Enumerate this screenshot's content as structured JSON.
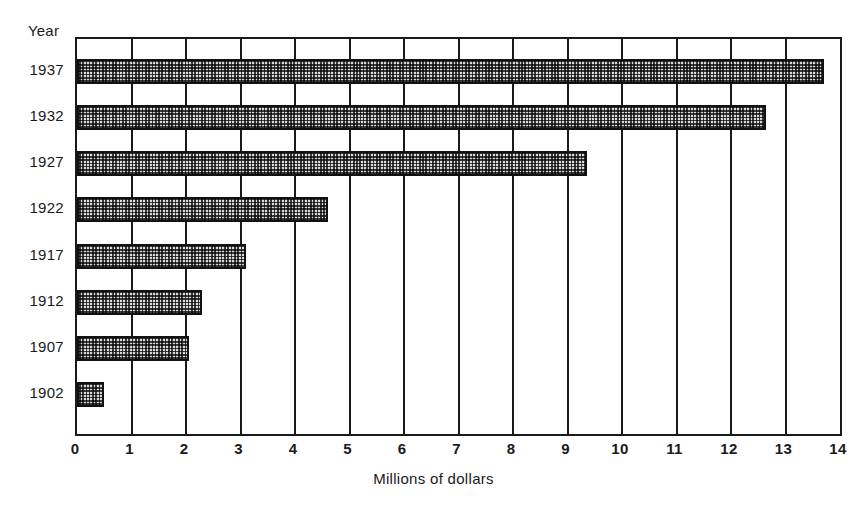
{
  "chart_data": {
    "type": "bar",
    "orientation": "horizontal",
    "title": "",
    "xlabel": "Millions of dollars",
    "ylabel": "Year",
    "categories": [
      "1937",
      "1932",
      "1927",
      "1922",
      "1917",
      "1912",
      "1907",
      "1902"
    ],
    "values": [
      13.7,
      12.65,
      9.35,
      4.6,
      3.1,
      2.3,
      2.05,
      0.5
    ],
    "xlim": [
      0,
      14
    ],
    "xticks": [
      "0",
      "1",
      "2",
      "3",
      "4",
      "5",
      "6",
      "7",
      "8",
      "9",
      "10",
      "11",
      "12",
      "13",
      "14"
    ],
    "xtick_values": [
      0,
      1,
      2,
      3,
      4,
      5,
      6,
      7,
      8,
      9,
      10,
      11,
      12,
      13,
      14
    ],
    "grid": "vertical",
    "legend": null,
    "bar_fill": "#d8d8d8",
    "bar_edge": "#111111",
    "axis_color": "#1a1a1a",
    "background": "#ffffff"
  },
  "axis": {
    "year_caption": "Year",
    "x_title": "Millions of dollars"
  }
}
